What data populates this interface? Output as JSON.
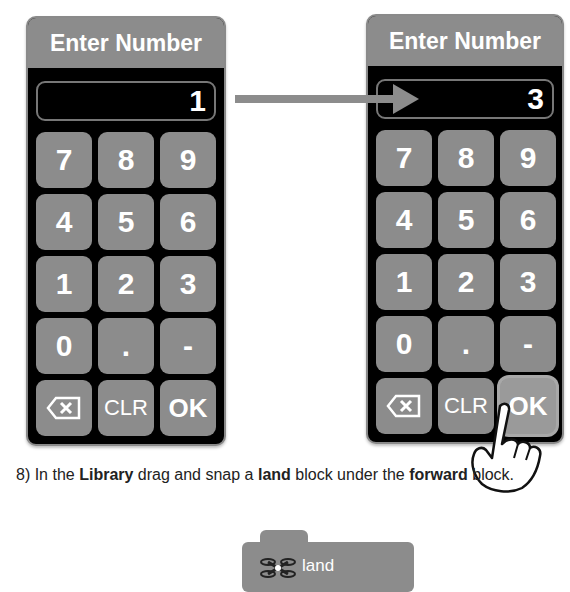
{
  "left_dialog": {
    "title": "Enter Number",
    "display_value": "1",
    "keys": [
      "7",
      "8",
      "9",
      "4",
      "5",
      "6",
      "1",
      "2",
      "3",
      "0",
      ".",
      "-"
    ],
    "backspace_icon": "backspace-icon",
    "clear_label": "CLR",
    "ok_label": "OK"
  },
  "right_dialog": {
    "title": "Enter Number",
    "display_value": "3",
    "keys": [
      "7",
      "8",
      "9",
      "4",
      "5",
      "6",
      "1",
      "2",
      "3",
      "0",
      ".",
      "-"
    ],
    "backspace_icon": "backspace-icon",
    "clear_label": "CLR",
    "ok_label": "OK"
  },
  "instruction": {
    "prefix": "8) In the ",
    "library": "Library",
    "mid1": " drag and snap a ",
    "land": "land",
    "mid2": " block under the ",
    "forward": "forward",
    "suffix": " block."
  },
  "block": {
    "label": "land",
    "icon": "drone-icon"
  },
  "colors": {
    "key_gray": "#8c8c8c",
    "panel_black": "#000000",
    "text_white": "#ffffff"
  }
}
